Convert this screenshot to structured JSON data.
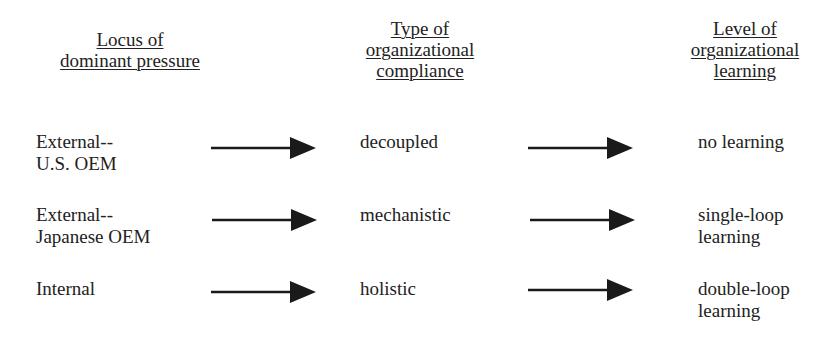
{
  "headers": {
    "col1": [
      "Locus of",
      "dominant pressure"
    ],
    "col2": [
      "Type of",
      "organizational",
      "compliance"
    ],
    "col3": [
      "Level of",
      "organizational",
      "learning"
    ]
  },
  "rows": [
    {
      "locus": [
        "External--",
        "U.S. OEM"
      ],
      "compliance": [
        "decoupled"
      ],
      "learning": [
        "no learning"
      ]
    },
    {
      "locus": [
        "External--",
        "Japanese OEM"
      ],
      "compliance": [
        "mechanistic"
      ],
      "learning": [
        "single-loop",
        "learning"
      ]
    },
    {
      "locus": [
        "Internal"
      ],
      "compliance": [
        "holistic"
      ],
      "learning": [
        "double-loop",
        "learning"
      ]
    }
  ],
  "colors": {
    "text": "#222222",
    "arrow": "#1a1a1a",
    "background": "#ffffff"
  }
}
